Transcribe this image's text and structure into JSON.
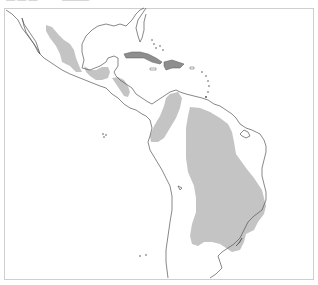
{
  "top_strip": {
    "fragments": [
      "— —  —",
      "———"
    ]
  },
  "map": {
    "title": "Distribution range map — Mexico, Central America, Caribbean, South America",
    "colors": {
      "background": "#ffffff",
      "frame": "#cfcfcf",
      "coastline": "#555555",
      "range_fill": "#c4c4c4",
      "island_fill": "#8e8e8e"
    },
    "regions": [
      {
        "name": "western-mexico-range"
      },
      {
        "name": "southern-mexico-yucatan-range"
      },
      {
        "name": "central-america-range"
      },
      {
        "name": "northern-andes-range"
      },
      {
        "name": "central-brazil-range"
      },
      {
        "name": "cuba-island"
      },
      {
        "name": "hispaniola-island"
      }
    ]
  }
}
